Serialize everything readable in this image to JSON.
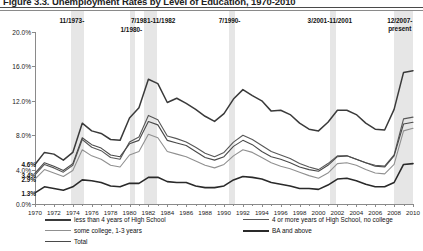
{
  "title": "Figure 3.3. Unemployment Rates by Level of Education, 1970-2010",
  "chart_data": {
    "type": "line",
    "title": "Figure 3.3. Unemployment Rates by Level of Education, 1970-2010",
    "xlabel": "",
    "ylabel": "",
    "xlim": [
      1970,
      2010
    ],
    "ylim": [
      0.0,
      20.0
    ],
    "grid": false,
    "legend_position": "bottom",
    "ytick_labels": [
      "0.0%",
      "4.0%",
      "8.0%",
      "12.0%",
      "16.0%",
      "20.0%"
    ],
    "ytick_values": [
      0.0,
      4.0,
      8.0,
      12.0,
      16.0,
      20.0
    ],
    "xtick_labels": [
      "1970",
      "1972",
      "1974",
      "1976",
      "1978",
      "1980",
      "1982",
      "1984",
      "1986",
      "1988",
      "1990",
      "1992",
      "1994",
      "1996",
      "1998",
      "2000",
      "2002",
      "2004",
      "2006",
      "2008",
      "2010"
    ],
    "xtick_values": [
      1970,
      1972,
      1974,
      1976,
      1978,
      1980,
      1982,
      1984,
      1986,
      1988,
      1990,
      1992,
      1994,
      1996,
      1998,
      2000,
      2002,
      2004,
      2006,
      2008,
      2010
    ],
    "x": [
      1970,
      1971,
      1972,
      1973,
      1974,
      1975,
      1976,
      1977,
      1978,
      1979,
      1980,
      1981,
      1982,
      1983,
      1984,
      1985,
      1986,
      1987,
      1988,
      1989,
      1990,
      1991,
      1992,
      1993,
      1994,
      1995,
      1996,
      1997,
      1998,
      1999,
      2000,
      2001,
      2002,
      2003,
      2004,
      2005,
      2006,
      2007,
      2008,
      2009,
      2010
    ],
    "series": [
      {
        "name": "less than 4 years of High School",
        "color": "#3a3a3a",
        "start_label": "4.6%",
        "values": [
          4.6,
          6.0,
          5.8,
          5.1,
          6.0,
          9.4,
          8.5,
          8.2,
          7.5,
          7.4,
          10.0,
          11.2,
          14.5,
          14.0,
          11.8,
          12.3,
          11.7,
          11.0,
          10.2,
          9.6,
          10.5,
          12.2,
          13.3,
          12.6,
          12.0,
          10.8,
          10.9,
          10.4,
          9.4,
          8.7,
          8.5,
          9.5,
          10.9,
          10.9,
          10.4,
          9.4,
          8.7,
          8.6,
          11.0,
          15.3,
          15.5
        ]
      },
      {
        "name": "4 or more years of High School, no college",
        "color": "#585858",
        "start_label": "3.4%",
        "values": [
          3.4,
          4.6,
          4.2,
          3.7,
          4.5,
          7.5,
          6.6,
          6.2,
          5.4,
          5.2,
          7.2,
          7.8,
          10.3,
          9.8,
          7.9,
          7.6,
          7.2,
          6.6,
          5.9,
          5.5,
          6.0,
          7.2,
          8.0,
          7.5,
          6.8,
          6.1,
          5.7,
          5.3,
          4.7,
          4.3,
          4.0,
          4.7,
          5.6,
          5.6,
          5.2,
          4.8,
          4.5,
          4.4,
          5.7,
          9.9,
          10.1
        ]
      },
      {
        "name": "some college, 1-3 years",
        "color": "#909090",
        "start_label": "2.9%",
        "values": [
          2.9,
          4.0,
          3.6,
          3.2,
          3.9,
          6.3,
          5.6,
          5.2,
          4.5,
          4.3,
          5.7,
          6.1,
          8.1,
          7.7,
          6.1,
          5.8,
          5.5,
          5.0,
          4.5,
          4.2,
          4.6,
          5.6,
          6.3,
          6.0,
          5.4,
          4.8,
          4.4,
          4.1,
          3.7,
          3.3,
          3.0,
          3.6,
          4.7,
          4.8,
          4.5,
          4.0,
          3.6,
          3.5,
          4.6,
          8.5,
          8.8
        ]
      },
      {
        "name": "BA and above",
        "color": "#2a2a2a",
        "start_label": "1.3%",
        "values": [
          1.3,
          2.0,
          1.8,
          1.6,
          2.0,
          2.8,
          2.7,
          2.5,
          2.1,
          2.0,
          2.4,
          2.4,
          3.1,
          3.1,
          2.6,
          2.5,
          2.5,
          2.1,
          1.9,
          1.9,
          2.1,
          2.8,
          3.2,
          3.1,
          2.9,
          2.5,
          2.3,
          2.1,
          1.8,
          1.8,
          1.7,
          2.2,
          2.9,
          3.0,
          2.7,
          2.3,
          2.0,
          2.0,
          2.5,
          4.6,
          4.7
        ]
      },
      {
        "name": "Total",
        "color": "#4a4a4a",
        "start_label": "",
        "values": [
          3.6,
          4.8,
          4.4,
          3.9,
          4.7,
          7.7,
          6.9,
          6.5,
          5.7,
          5.5,
          7.0,
          7.4,
          9.6,
          9.2,
          7.4,
          7.1,
          6.8,
          6.1,
          5.4,
          5.1,
          5.5,
          6.7,
          7.4,
          6.9,
          6.1,
          5.5,
          5.2,
          4.8,
          4.3,
          4.0,
          3.8,
          4.5,
          5.5,
          5.6,
          5.2,
          4.8,
          4.4,
          4.3,
          5.6,
          9.3,
          9.5
        ]
      }
    ],
    "annotations": [
      {
        "text": "11/1973-",
        "x": 1973.9
      },
      {
        "text": "1/1980-",
        "x": 1980.2
      },
      {
        "text": "7/1981-11/1982",
        "x": 1982.5
      },
      {
        "text": "7/1990-",
        "x": 1990.6
      },
      {
        "text": "3/2001-11/2001",
        "x": 2001.2
      },
      {
        "text": "12/2007-\npresent",
        "x": 2008.6
      }
    ],
    "recession_bands": [
      {
        "start": 1973.85,
        "end": 1975.2
      },
      {
        "start": 1980.0,
        "end": 1980.55
      },
      {
        "start": 1981.5,
        "end": 1982.9
      },
      {
        "start": 1990.5,
        "end": 1991.2
      },
      {
        "start": 2001.2,
        "end": 2001.9
      },
      {
        "start": 2007.95,
        "end": 2010.2
      }
    ]
  },
  "legend": {
    "items": [
      {
        "label": "less than 4 years of High School",
        "swatch": "t1"
      },
      {
        "label": "4 or more years of High School, no college",
        "swatch": "t2"
      },
      {
        "label": "some college, 1-3 years",
        "swatch": "t3"
      },
      {
        "label": "BA and above",
        "swatch": "t4"
      },
      {
        "label": "Total",
        "swatch": "t5"
      }
    ]
  }
}
